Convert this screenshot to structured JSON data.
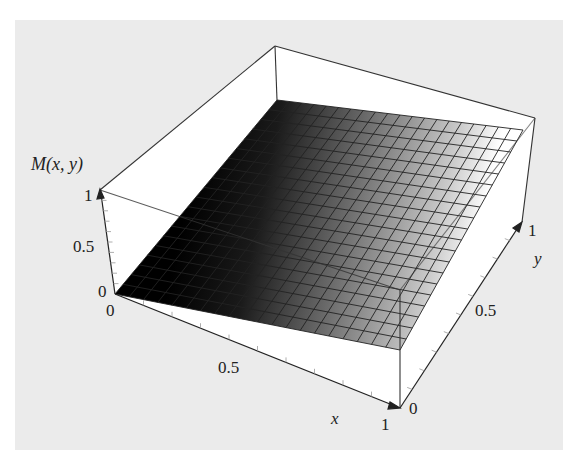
{
  "chart_data": {
    "type": "surface3d",
    "title": "",
    "zlabel": "M(x, y)",
    "xlabel": "x",
    "ylabel": "y",
    "x_ticks": [
      "0",
      "0.5",
      "1"
    ],
    "y_ticks": [
      "0",
      "0.5",
      "1"
    ],
    "z_ticks": [
      "0",
      "0.5",
      "1"
    ],
    "xlim": [
      0,
      1
    ],
    "ylim": [
      0,
      1
    ],
    "zlim": [
      0,
      1
    ],
    "grid_divisions": 20,
    "surface_corners": {
      "x0_y0": 0,
      "x1_y0": 0.5,
      "x0_y1": 1,
      "x1_y1": 1
    },
    "shading": "grayscale gradient, dark near x=0 to light near x=1",
    "box": true
  },
  "labels": {
    "z_axis": "M(x, y)",
    "z_tick_1": "1",
    "z_tick_05": "0.5",
    "z_tick_0": "0",
    "x_tick_0": "0",
    "x_tick_05": "0.5",
    "x_tick_1": "1",
    "x_axis": "x",
    "y_tick_0": "0",
    "y_tick_05": "0.5",
    "y_tick_1": "1",
    "y_axis": "y"
  },
  "colors": {
    "background": "#ebebeb",
    "box_face": "#ffffff",
    "line": "#333333",
    "surface_dark": "#000000",
    "surface_light": "#ffffff"
  }
}
